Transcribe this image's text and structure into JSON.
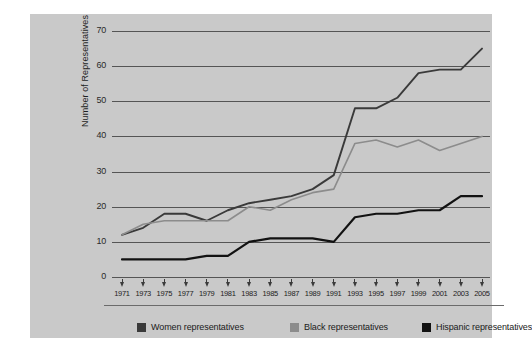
{
  "chart_data": {
    "type": "line",
    "title": "",
    "xlabel": "",
    "ylabel": "Number of Representatives",
    "categories": [
      "1971",
      "1973",
      "1975",
      "1977",
      "1979",
      "1981",
      "1983",
      "1985",
      "1987",
      "1989",
      "1991",
      "1993",
      "1995",
      "1997",
      "1999",
      "2001",
      "2003",
      "2005"
    ],
    "x": [
      1971,
      1973,
      1975,
      1977,
      1979,
      1981,
      1983,
      1985,
      1987,
      1989,
      1991,
      1993,
      1995,
      1997,
      1999,
      2001,
      2003,
      2005
    ],
    "ylim": [
      0,
      70
    ],
    "xlim": [
      1971,
      2005
    ],
    "yticks": [
      0,
      10,
      20,
      30,
      40,
      50,
      60,
      70
    ],
    "ytick_labels": [
      "0",
      "10",
      "20",
      "30",
      "40",
      "50",
      "60",
      "70"
    ],
    "grid": true,
    "legend_position": "bottom",
    "series": [
      {
        "name": "Women representatives",
        "color": "#3a3a3a",
        "values": [
          12,
          14,
          18,
          18,
          16,
          19,
          21,
          22,
          23,
          25,
          29,
          48,
          48,
          51,
          58,
          59,
          59,
          65
        ]
      },
      {
        "name": "Black representatives",
        "color": "#8c8c8c",
        "values": [
          12,
          15,
          16,
          16,
          16,
          16,
          20,
          19,
          22,
          24,
          25,
          38,
          39,
          37,
          39,
          36,
          38,
          40
        ]
      },
      {
        "name": "Hispanic representatives",
        "color": "#121212",
        "values": [
          5,
          5,
          5,
          5,
          6,
          6,
          10,
          11,
          11,
          11,
          10,
          17,
          18,
          18,
          19,
          19,
          23,
          23
        ]
      }
    ]
  },
  "legend": {
    "items": [
      {
        "label": "Women representatives",
        "color": "#3a3a3a"
      },
      {
        "label": "Black representatives",
        "color": "#8c8c8c"
      },
      {
        "label": "Hispanic representatives",
        "color": "#121212"
      }
    ]
  },
  "colors": {
    "panel_background": "#c9c9c9",
    "page_background": "#ffffff",
    "gridline": "#555555",
    "axis_text": "#222222"
  }
}
